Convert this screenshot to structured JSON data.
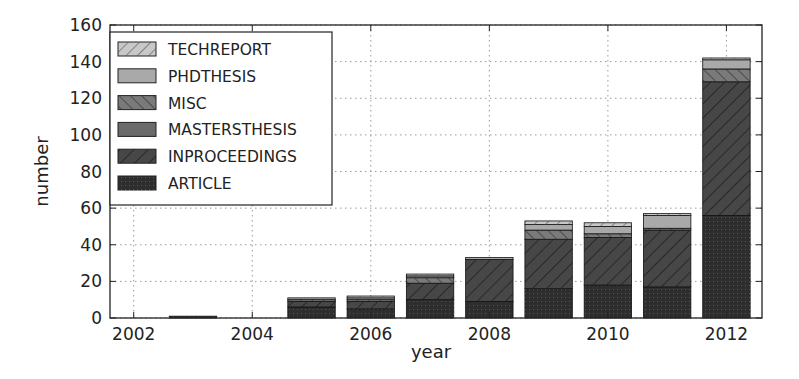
{
  "chart_data": {
    "type": "bar",
    "stacked": true,
    "title": "",
    "xlabel": "year",
    "ylabel": "number",
    "ylim": [
      0,
      160
    ],
    "xlim": [
      2001.6,
      2012.6
    ],
    "yticks": [
      0,
      20,
      40,
      60,
      80,
      100,
      120,
      140,
      160
    ],
    "xticks": [
      2002,
      2004,
      2006,
      2008,
      2010,
      2012
    ],
    "grid": true,
    "legend_position": "upper left",
    "categories": [
      2003,
      2005,
      2006,
      2007,
      2008,
      2009,
      2010,
      2011,
      2012
    ],
    "series": [
      {
        "name": "ARTICLE",
        "color": "#2e2e2e",
        "hatch": "dots",
        "values": [
          1,
          6,
          5,
          10,
          9,
          16,
          18,
          17,
          56
        ]
      },
      {
        "name": "INPROCEEDINGS",
        "color": "#474747",
        "hatch": "slash",
        "values": [
          0,
          3,
          4,
          9,
          23,
          27,
          26,
          31,
          73
        ]
      },
      {
        "name": "MASTERSTHESIS",
        "color": "#6a6a6a",
        "hatch": "none",
        "values": [
          0,
          0,
          0,
          0,
          0,
          0,
          0,
          0,
          0
        ]
      },
      {
        "name": "MISC",
        "color": "#7a7a7a",
        "hatch": "backslash",
        "values": [
          0,
          1,
          1,
          3,
          0,
          5,
          2,
          1,
          7
        ]
      },
      {
        "name": "PHDTHESIS",
        "color": "#a9a9a9",
        "hatch": "none",
        "values": [
          0,
          1,
          1,
          1,
          1,
          3,
          4,
          7,
          5
        ]
      },
      {
        "name": "TECHREPORT",
        "color": "#c8c8c8",
        "hatch": "slash",
        "values": [
          0,
          0,
          1,
          1,
          0,
          2,
          2,
          1,
          1
        ]
      }
    ],
    "totals": [
      1,
      11,
      12,
      24,
      33,
      53,
      52,
      57,
      142
    ]
  },
  "legend": {
    "items": [
      "TECHREPORT",
      "PHDTHESIS",
      "MISC",
      "MASTERSTHESIS",
      "INPROCEEDINGS",
      "ARTICLE"
    ]
  }
}
